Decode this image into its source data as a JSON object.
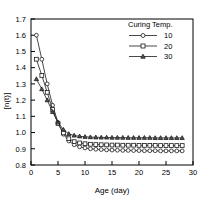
{
  "chart_data": {
    "type": "line",
    "title": "",
    "xlabel": "Age (day)",
    "ylabel": "[n(t)]",
    "xlim": [
      0,
      30
    ],
    "ylim": [
      0.8,
      1.7
    ],
    "xticks": [
      "0",
      "5",
      "10",
      "15",
      "20",
      "25",
      "30"
    ],
    "yticks": [
      "0.8",
      "0.9",
      "1.0",
      "1.1",
      "1.2",
      "1.3",
      "1.4",
      "1.5",
      "1.6",
      "1.7"
    ],
    "grid": false,
    "legend": {
      "title": "Curing Temp.",
      "position": "top-right",
      "entries": [
        {
          "label": "10",
          "marker": "circle"
        },
        {
          "label": "20",
          "marker": "square"
        },
        {
          "label": "30",
          "marker": "triangle"
        }
      ]
    },
    "x": [
      1,
      2,
      3,
      4,
      5,
      6,
      7,
      8,
      9,
      10,
      11,
      12,
      13,
      14,
      15,
      16,
      17,
      18,
      19,
      20,
      21,
      22,
      23,
      24,
      25,
      26,
      27,
      28
    ],
    "series": [
      {
        "name": "10",
        "marker": "circle",
        "values": [
          1.6,
          1.452,
          1.3,
          1.168,
          1.062,
          0.99,
          0.948,
          0.925,
          0.912,
          0.905,
          0.9,
          0.897,
          0.895,
          0.893,
          0.892,
          0.891,
          0.89,
          0.89,
          0.889,
          0.889,
          0.888,
          0.888,
          0.888,
          0.887,
          0.887,
          0.887,
          0.887,
          0.887
        ]
      },
      {
        "name": "20",
        "marker": "square",
        "values": [
          1.452,
          1.352,
          1.248,
          1.142,
          1.055,
          0.998,
          0.962,
          0.944,
          0.936,
          0.931,
          0.928,
          0.926,
          0.925,
          0.924,
          0.923,
          0.923,
          0.922,
          0.922,
          0.922,
          0.921,
          0.921,
          0.921,
          0.921,
          0.92,
          0.92,
          0.92,
          0.92,
          0.92
        ]
      },
      {
        "name": "30",
        "marker": "triangle",
        "values": [
          1.33,
          1.268,
          1.2,
          1.128,
          1.062,
          1.018,
          0.992,
          0.982,
          0.977,
          0.974,
          0.972,
          0.971,
          0.97,
          0.97,
          0.969,
          0.969,
          0.969,
          0.968,
          0.968,
          0.968,
          0.968,
          0.968,
          0.967,
          0.967,
          0.967,
          0.967,
          0.967,
          0.967
        ]
      }
    ]
  },
  "colors": {
    "axis": "#000000",
    "series": "#1a1a1a",
    "background": "#ffffff"
  }
}
